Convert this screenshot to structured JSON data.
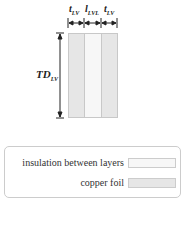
{
  "diagram": {
    "labels": {
      "t_lv_left": {
        "main": "t",
        "sub": "LV"
      },
      "l_lvl": {
        "main": "l",
        "sub": "LVL"
      },
      "t_lv_right": {
        "main": "t",
        "sub": "LV"
      },
      "td_lv": {
        "main": "TD",
        "sub": "LV"
      }
    },
    "colors": {
      "copper_foil": "#e6e6e6",
      "insulation": "#f7f7f7",
      "arrow": "#222222"
    }
  },
  "legend": {
    "items": [
      {
        "label": "insulation between layers",
        "color": "#f7f7f7"
      },
      {
        "label": "copper foil",
        "color": "#e6e6e6"
      }
    ]
  }
}
